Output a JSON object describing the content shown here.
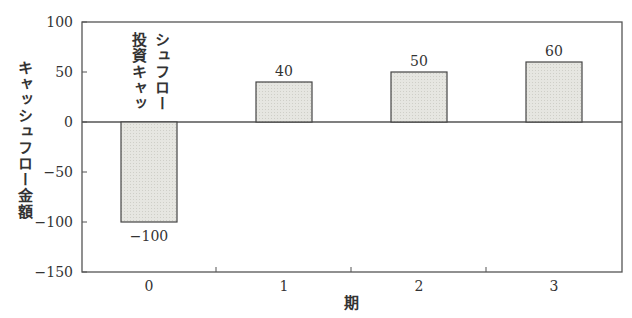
{
  "chart_data": {
    "type": "bar",
    "title": "",
    "xlabel": "期",
    "ylabel": "キャッシュフロー金額",
    "categories": [
      "0",
      "1",
      "2",
      "3"
    ],
    "values": [
      -100,
      40,
      50,
      60
    ],
    "data_labels": [
      "−100",
      "40",
      "50",
      "60"
    ],
    "annotations": [
      {
        "text_line1": "投資キャッ",
        "text_line2": "シュフロー",
        "category": "0"
      }
    ],
    "yticks": [
      100,
      50,
      0,
      -50,
      -100,
      -150
    ],
    "ytick_labels": [
      "100",
      "50",
      "0",
      "−50",
      "−100",
      "−150"
    ],
    "ylim": [
      -150,
      100
    ],
    "grid": false,
    "legend": null,
    "colors": {
      "bar_fill": "#e4e4df",
      "bar_stroke": "#444444",
      "axis": "#555555"
    }
  }
}
